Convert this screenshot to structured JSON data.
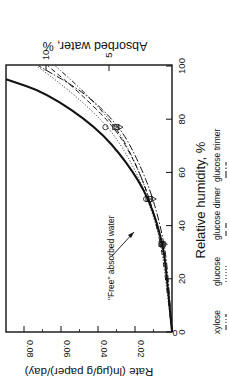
{
  "chart_data": {
    "type": "line",
    "orientation": "rotated 90 degrees clockwise (x-axis runs bottom-to-top on right side)",
    "xlabel": "Relative humidity, %",
    "ylabel": "Rate (ln(μg/g paper)/day)",
    "y2label": "Absorbed water, %",
    "xlim": [
      0,
      100
    ],
    "ylim": [
      0,
      0.089
    ],
    "y2lim": [
      0,
      13.2
    ],
    "xticks": [
      0,
      20,
      40,
      60,
      80,
      100
    ],
    "yticks": [
      0,
      0.02,
      0.04,
      0.06,
      0.08
    ],
    "yticklabels": [
      "0",
      "0.02",
      "0.04",
      "0.06",
      "0.08"
    ],
    "y2ticks": [
      5,
      10
    ],
    "grid": false,
    "annotation": {
      "text": "\"Free\" absorbed water",
      "arrow_to": [
        37,
        0.01
      ]
    },
    "legend": [
      "xylose",
      "glucose",
      "glucose dimer",
      "glucose trimer"
    ],
    "series": [
      {
        "name": "xylose",
        "style": "dash-dot-dot",
        "x": [
          0,
          20,
          33,
          50,
          64,
          77,
          90,
          100
        ],
        "values": [
          0,
          0.0035,
          0.006,
          0.012,
          0.02,
          0.03,
          0.047,
          0.063
        ],
        "markers": [
          [
            33,
            0.006
          ],
          [
            50,
            0.013
          ],
          [
            77,
            0.031
          ]
        ]
      },
      {
        "name": "glucose",
        "style": "dotted",
        "x": [
          0,
          20,
          33,
          50,
          64,
          77,
          90,
          100
        ],
        "values": [
          0,
          0.003,
          0.0055,
          0.013,
          0.022,
          0.034,
          0.054,
          0.073
        ],
        "markers": [
          [
            33,
            0.0055
          ],
          [
            50,
            0.014
          ],
          [
            77,
            0.036
          ]
        ]
      },
      {
        "name": "glucose dimer",
        "style": "dashed",
        "x": [
          0,
          20,
          33,
          50,
          64,
          77,
          90,
          100
        ],
        "values": [
          0,
          0.0025,
          0.005,
          0.012,
          0.02,
          0.031,
          0.05,
          0.067
        ],
        "markers": [
          [
            33,
            0.005
          ],
          [
            50,
            0.012
          ],
          [
            77,
            0.03
          ]
        ]
      },
      {
        "name": "glucose trimer",
        "style": "dash-dot",
        "x": [
          0,
          20,
          33,
          50,
          64,
          77,
          90,
          100
        ],
        "values": [
          0,
          0.002,
          0.004,
          0.01,
          0.018,
          0.028,
          0.047,
          0.072
        ],
        "markers": [
          [
            33,
            0.004
          ],
          [
            50,
            0.01
          ],
          [
            77,
            0.028
          ]
        ]
      },
      {
        "name": "\"Free\" absorbed water",
        "style": "solid-thick",
        "axis": "y2",
        "x": [
          0,
          20,
          33,
          50,
          64,
          77,
          90,
          95
        ],
        "values": [
          0,
          0.4,
          0.7,
          1.8,
          3.6,
          6.0,
          10.0,
          13.2
        ]
      }
    ]
  }
}
